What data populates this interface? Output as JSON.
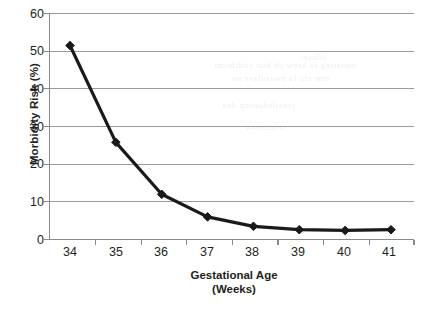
{
  "chart_data": {
    "type": "line",
    "title": "",
    "xlabel": "Gestational Age",
    "xlabel_line2": "(Weeks)",
    "ylabel": "Morbidity Risk (%)",
    "categories": [
      "34",
      "35",
      "36",
      "37",
      "38",
      "39",
      "40",
      "41"
    ],
    "x": [
      34,
      35,
      36,
      37,
      38,
      39,
      40,
      41
    ],
    "values": [
      51.5,
      25.8,
      12.0,
      6.0,
      3.5,
      2.6,
      2.4,
      2.6
    ],
    "series": [
      {
        "name": "Morbidity Risk",
        "values": [
          51.5,
          25.8,
          12.0,
          6.0,
          3.5,
          2.6,
          2.4,
          2.6
        ]
      }
    ],
    "ylim": [
      0,
      60
    ],
    "yticks": [
      0,
      10,
      20,
      30,
      40,
      50,
      60
    ],
    "ytick_labels": [
      "0",
      "10",
      "20",
      "30",
      "40",
      "50",
      "60"
    ],
    "xtick_labels": [
      "34",
      "35",
      "36",
      "37",
      "38",
      "39",
      "40",
      "41"
    ],
    "grid": "horizontal",
    "legend": "none",
    "marker": "diamond",
    "line_color": "#1a1a1a",
    "marker_color": "#1a1a1a",
    "grid_color": "#9a9a9a",
    "axis_color": "#808080",
    "background_color": "#ffffff",
    "text_color": "#231f20"
  },
  "artifacts": {
    "bleed_through": [
      "noitatseg fo keew yb ksir ytidibrom",
      "etar eht fo noitaulave na",
      "yrevilediatsop dna",
      "setaicossa",
      "stluser"
    ]
  }
}
